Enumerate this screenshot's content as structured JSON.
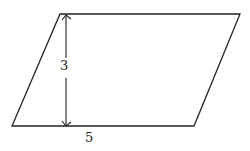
{
  "diagram": {
    "shape": "parallelogram",
    "height_label": "3",
    "base_label": "5",
    "stroke_color": "#222222",
    "background": "#ffffff"
  }
}
